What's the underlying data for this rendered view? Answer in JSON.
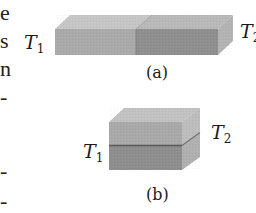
{
  "figure": {
    "panel_a": {
      "caption": "(a)",
      "left_label": {
        "main": "T",
        "sub": "1"
      },
      "right_label": {
        "main": "T",
        "sub": "2"
      },
      "arrangement": "slabs end-to-end (series)"
    },
    "panel_b": {
      "caption": "(b)",
      "left_label": {
        "main": "T",
        "sub": "1"
      },
      "right_label": {
        "main": "T",
        "sub": "2"
      },
      "arrangement": "slabs stacked (parallel)"
    },
    "colors": {
      "light_front": "#a8a8a8",
      "dark_front": "#8e8e8e",
      "top_face": "#c4c4c4",
      "side_face": "#b4b4b4",
      "divider": "#5a5a5a"
    }
  },
  "margin_fragments": [
    "e",
    "s",
    "n",
    "-",
    "-",
    "-"
  ]
}
